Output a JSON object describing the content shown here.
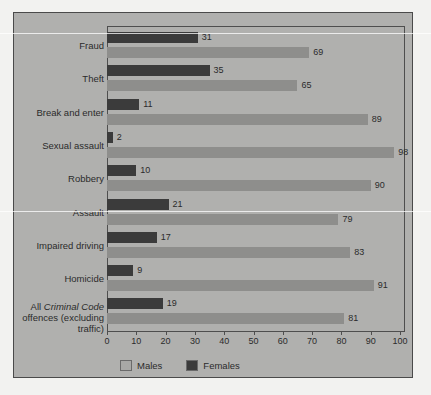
{
  "chart_data": {
    "type": "bar",
    "orientation": "horizontal",
    "title": "",
    "subtitle": "",
    "xlabel": "",
    "ylabel": "",
    "xlim": [
      0,
      100
    ],
    "xticks": [
      0,
      10,
      20,
      30,
      40,
      50,
      60,
      70,
      80,
      90,
      100
    ],
    "xtick_labels": [
      "0",
      "10",
      "20",
      "30",
      "40",
      "50",
      "60",
      "70",
      "80",
      "90",
      "100"
    ],
    "grid": false,
    "legend_position": "bottom",
    "categories": [
      "Fraud",
      "Theft",
      "Break and enter",
      "Sexual assault",
      "Robbery",
      "Assault",
      "Impaired driving",
      "Homicide",
      "All Criminal Code offences (excluding traffic)"
    ],
    "series": [
      {
        "name": "Males",
        "color": "#8e8e8c",
        "values": [
          69,
          65,
          89,
          98,
          90,
          79,
          83,
          91,
          81
        ]
      },
      {
        "name": "Females",
        "color": "#3b3b3b",
        "values": [
          31,
          35,
          11,
          2,
          10,
          21,
          17,
          9,
          19
        ]
      }
    ]
  },
  "legend": {
    "items": [
      {
        "label": "Males",
        "swatch": "male"
      },
      {
        "label": "Females",
        "swatch": "female"
      }
    ]
  },
  "category_labels": [
    {
      "lines": [
        {
          "text": "Fraud",
          "italic": false
        }
      ]
    },
    {
      "lines": [
        {
          "text": "Theft",
          "italic": false
        }
      ]
    },
    {
      "lines": [
        {
          "text": "Break and enter",
          "italic": false
        }
      ]
    },
    {
      "lines": [
        {
          "text": "Sexual assault",
          "italic": false
        }
      ]
    },
    {
      "lines": [
        {
          "text": "Robbery",
          "italic": false
        }
      ]
    },
    {
      "lines": [
        {
          "text": "Assault",
          "italic": false
        }
      ]
    },
    {
      "lines": [
        {
          "text": "Impaired driving",
          "italic": false
        }
      ]
    },
    {
      "lines": [
        {
          "text": "Homicide",
          "italic": false
        }
      ]
    },
    {
      "lines": [
        {
          "text": "All ",
          "italic": false,
          "italic_part": "Criminal Code"
        },
        {
          "text": "offences (excluding",
          "italic": false
        },
        {
          "text": "traffic)",
          "italic": false
        }
      ]
    }
  ],
  "colors": {
    "panel_background": "#b0b0ae",
    "figure_background": "#f2f2f0",
    "frame": "#4a4a4a",
    "males_bar": "#8e8e8c",
    "females_bar": "#3b3b3b",
    "text": "#2b2b2b"
  }
}
